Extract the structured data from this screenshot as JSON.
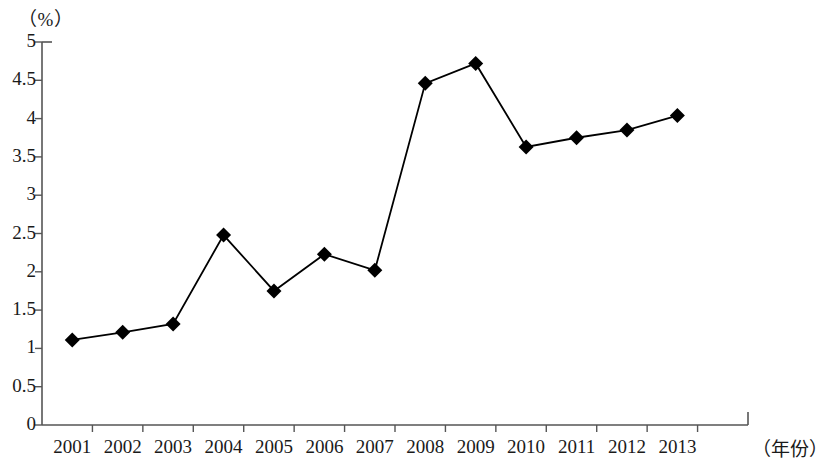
{
  "chart_data": {
    "type": "line",
    "title": "",
    "subtitle": "",
    "xlabel": "（年份）",
    "ylabel": "（%）",
    "categories": [
      "2001",
      "2002",
      "2003",
      "2004",
      "2005",
      "2006",
      "2007",
      "2008",
      "2009",
      "2010",
      "2011",
      "2012",
      "2013"
    ],
    "values": [
      1.11,
      1.21,
      1.32,
      2.48,
      1.75,
      2.23,
      2.02,
      4.46,
      4.72,
      3.63,
      3.75,
      3.85,
      4.04
    ],
    "series": [
      {
        "name": "",
        "values": [
          1.11,
          1.21,
          1.32,
          2.48,
          1.75,
          2.23,
          2.02,
          4.46,
          4.72,
          3.63,
          3.75,
          3.85,
          4.04
        ]
      }
    ],
    "ylim": [
      0,
      5
    ],
    "yticks": [
      0,
      0.5,
      1,
      1.5,
      2,
      2.5,
      3,
      3.5,
      4,
      4.5,
      5
    ],
    "ytick_labels": [
      "0",
      "0.5",
      "1",
      "1.5",
      "2",
      "2.5",
      "3",
      "3.5",
      "4",
      "4.5",
      "5"
    ],
    "xtick_labels": [
      "2001",
      "2002",
      "2003",
      "2004",
      "2005",
      "2006",
      "2007",
      "2008",
      "2009",
      "2010",
      "2011",
      "2012",
      "2013"
    ],
    "grid": false,
    "legend": false,
    "legend_position": "none",
    "marker": "diamond",
    "line_color": "#000000",
    "marker_color": "#000000",
    "axis_color": "#555555",
    "background_color": "#ffffff"
  }
}
